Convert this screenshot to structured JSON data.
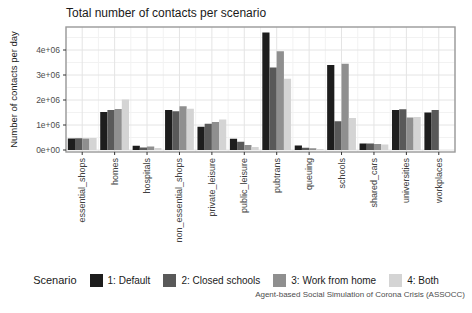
{
  "title": "Total number of contacts per scenario",
  "y_axis_title": "Number of contacts per day",
  "caption": "Agent-based Social Simulation of Corona Crisis (ASSOCC)",
  "legend": {
    "title": "Scenario",
    "entries": [
      {
        "label": "1: Default",
        "color": "#1d1d1d"
      },
      {
        "label": "2: Closed schools",
        "color": "#595959"
      },
      {
        "label": "3: Work from home",
        "color": "#8f8f8f"
      },
      {
        "label": "4: Both",
        "color": "#d4d4d4"
      }
    ]
  },
  "chart_data": {
    "type": "bar",
    "title": "Total number of contacts per scenario",
    "xlabel": "",
    "ylabel": "Number of contacts per day",
    "categories": [
      "essential_shops",
      "homes",
      "hospitals",
      "non_essential_shops",
      "private_leisure",
      "public_leisure",
      "pubtrans",
      "queuing",
      "schools",
      "shared_cars",
      "universities",
      "workplaces"
    ],
    "series": [
      {
        "name": "1: Default",
        "color": "#1d1d1d",
        "values": [
          460000,
          1520000,
          170000,
          1600000,
          930000,
          450000,
          4700000,
          180000,
          3400000,
          260000,
          1600000,
          1500000
        ]
      },
      {
        "name": "2: Closed schools",
        "color": "#595959",
        "values": [
          470000,
          1600000,
          100000,
          1550000,
          1050000,
          330000,
          3300000,
          90000,
          1150000,
          260000,
          1630000,
          1600000
        ]
      },
      {
        "name": "3: Work from home",
        "color": "#8f8f8f",
        "values": [
          460000,
          1640000,
          140000,
          1750000,
          1120000,
          200000,
          3950000,
          70000,
          3450000,
          240000,
          1300000,
          0
        ]
      },
      {
        "name": "4: Both",
        "color": "#d4d4d4",
        "values": [
          480000,
          2020000,
          80000,
          1650000,
          1220000,
          120000,
          2850000,
          40000,
          1280000,
          220000,
          1320000,
          0
        ]
      }
    ],
    "y_ticks": [
      {
        "value": 0,
        "label": "0e+00"
      },
      {
        "value": 1000000,
        "label": "1e+06"
      },
      {
        "value": 2000000,
        "label": "2e+06"
      },
      {
        "value": 3000000,
        "label": "3e+06"
      },
      {
        "value": 4000000,
        "label": "4e+06"
      }
    ],
    "ylim": [
      0,
      4900000
    ],
    "grid": true,
    "x_tick_rotation": 90,
    "legend_position": "bottom",
    "panel_border_color": "#999999",
    "grid_major_color": "#e4e4e4",
    "grid_minor_color": "#f2f2f2",
    "axis_text_color": "#4d4d4d"
  }
}
